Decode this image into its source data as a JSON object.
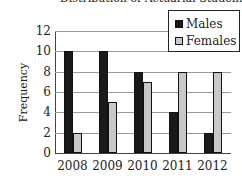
{
  "chart_data": {
    "type": "bar",
    "title": "Distribution of Actuarial Students",
    "xlabel": "",
    "ylabel": "Frequency",
    "categories": [
      "2008",
      "2009",
      "2010",
      "2011",
      "2012"
    ],
    "series": [
      {
        "name": "Males",
        "color": "#1a1a1a",
        "values": [
          10,
          10,
          8,
          4,
          2
        ]
      },
      {
        "name": "Females",
        "color": "#c8c8c8",
        "values": [
          2,
          5,
          7,
          8,
          8
        ]
      }
    ],
    "ylim": [
      0,
      12
    ],
    "yticks": [
      "0",
      "2",
      "4",
      "6",
      "8",
      "10",
      "12"
    ],
    "grid": true,
    "legend_position": "top-right"
  }
}
